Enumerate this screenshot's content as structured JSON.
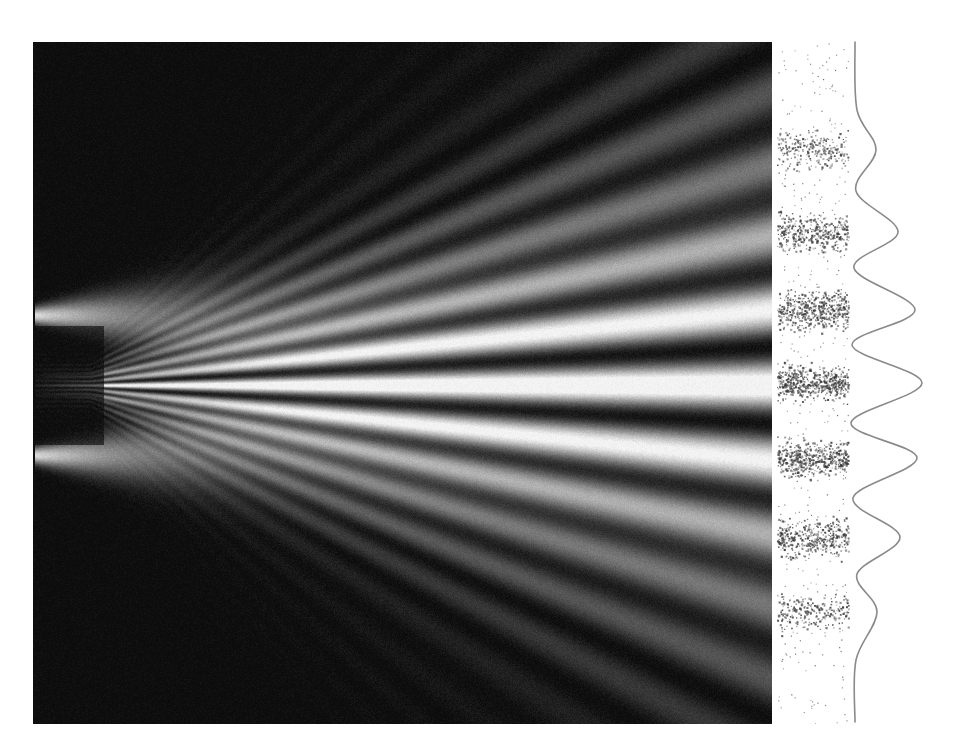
{
  "figure": {
    "title": "Double-slit interference: wave field, particle detections and intensity profile",
    "panels": {
      "wave_field": "simulated wave intensity",
      "detections": "individual particle hits",
      "profile": "intensity distribution"
    }
  },
  "colors": {
    "background": "#ffffff",
    "field_dark": "#0c0c0c",
    "field_bright": "#f4f4f4",
    "hits": "#3a3a3a",
    "curve": "#8a8a8a"
  },
  "chart_data": {
    "type": "line",
    "xlabel": "",
    "ylabel": "",
    "grid": false,
    "slits": {
      "x": 34,
      "y": [
        315,
        455
      ],
      "center_y": 385
    },
    "fan_origin": {
      "x": 90,
      "y": 385
    },
    "screen_fringes_y": [
      160,
      235,
      310,
      383,
      457,
      535,
      610
    ],
    "profile": {
      "baseline_x": 855,
      "points": [
        {
          "y": 42,
          "x": 855
        },
        {
          "y": 110,
          "x": 857
        },
        {
          "y": 150,
          "x": 876
        },
        {
          "y": 191,
          "x": 856
        },
        {
          "y": 232,
          "x": 898
        },
        {
          "y": 268,
          "x": 854
        },
        {
          "y": 310,
          "x": 915
        },
        {
          "y": 345,
          "x": 852
        },
        {
          "y": 383,
          "x": 922
        },
        {
          "y": 423,
          "x": 851
        },
        {
          "y": 458,
          "x": 917
        },
        {
          "y": 498,
          "x": 853
        },
        {
          "y": 537,
          "x": 900
        },
        {
          "y": 574,
          "x": 857
        },
        {
          "y": 612,
          "x": 877
        },
        {
          "y": 660,
          "x": 856
        },
        {
          "y": 722,
          "x": 855
        }
      ],
      "peaks": [
        {
          "order": -3,
          "y": 150,
          "relative_intensity": 0.3
        },
        {
          "order": -2,
          "y": 232,
          "relative_intensity": 0.64
        },
        {
          "order": -1,
          "y": 310,
          "relative_intensity": 0.9
        },
        {
          "order": 0,
          "y": 383,
          "relative_intensity": 1.0
        },
        {
          "order": 1,
          "y": 458,
          "relative_intensity": 0.93
        },
        {
          "order": 2,
          "y": 537,
          "relative_intensity": 0.67
        },
        {
          "order": 3,
          "y": 612,
          "relative_intensity": 0.33
        }
      ]
    },
    "hit_bands": [
      {
        "y": 150,
        "density": 0.45
      },
      {
        "y": 232,
        "density": 0.75
      },
      {
        "y": 310,
        "density": 0.9
      },
      {
        "y": 383,
        "density": 1.0
      },
      {
        "y": 458,
        "density": 0.95
      },
      {
        "y": 537,
        "density": 0.75
      },
      {
        "y": 612,
        "density": 0.45
      }
    ]
  }
}
